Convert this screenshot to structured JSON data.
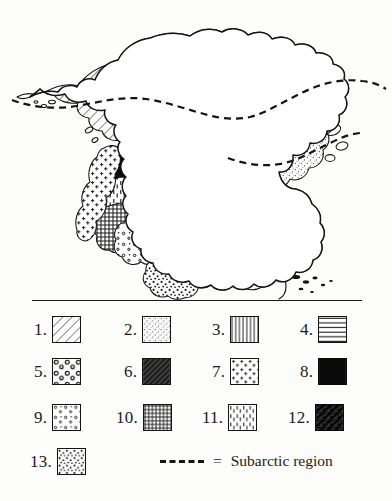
{
  "figure": {
    "type": "map",
    "region": "North America",
    "style": "hand-drawn pen-and-ink vegetation / biome map",
    "background_color": "#fdfdfb",
    "ink_color": "#141414"
  },
  "map": {
    "name": "north-america-vegetation-map",
    "subarctic_line_style": "dashed",
    "areas": [
      {
        "pattern": 1,
        "name": "diagonal-hatch-region",
        "location": "Alaska and central/northern Canada (boreal)"
      },
      {
        "pattern": 2,
        "name": "fine-stipple-region",
        "location": "Arctic Canada, Hudson Bay margin, eastern Canada"
      },
      {
        "pattern": 3,
        "name": "vertical-line-region",
        "location": "eastern United States / Appalachians"
      },
      {
        "pattern": 4,
        "name": "horizontal-line-region",
        "location": "northern Great Plains / prairie"
      },
      {
        "pattern": 5,
        "name": "circles-region",
        "location": "southeastern United States / Gulf coast"
      },
      {
        "pattern": 6,
        "name": "dense-dark-hatch-region",
        "location": "central plains interior"
      },
      {
        "pattern": 7,
        "name": "plus-marks-region",
        "location": "Pacific Northwest coastal strip"
      },
      {
        "pattern": 8,
        "name": "solid-black-region",
        "location": "Great Basin / western interior"
      },
      {
        "pattern": 9,
        "name": "sparse-dots-region",
        "location": "Rocky Mountain intermontane"
      },
      {
        "pattern": 10,
        "name": "crosshatch-grid-region",
        "location": "southwestern United States"
      },
      {
        "pattern": 11,
        "name": "vertical-dash-region",
        "location": "Great Basin desert scrub"
      },
      {
        "pattern": 12,
        "name": "dark-scribble-region",
        "location": "south-central plains"
      },
      {
        "pattern": 13,
        "name": "dense-dots-region",
        "location": "Mexican plateau / southern margin"
      }
    ]
  },
  "legend": {
    "name": "map-legend",
    "items": [
      {
        "number": "1.",
        "pattern": "diagonal-hatch"
      },
      {
        "number": "2.",
        "pattern": "fine-stipple"
      },
      {
        "number": "3.",
        "pattern": "vertical-lines"
      },
      {
        "number": "4.",
        "pattern": "horizontal-lines"
      },
      {
        "number": "5.",
        "pattern": "circles"
      },
      {
        "number": "6.",
        "pattern": "dense-dark-hatch"
      },
      {
        "number": "7.",
        "pattern": "plus-marks"
      },
      {
        "number": "8.",
        "pattern": "solid-black"
      },
      {
        "number": "9.",
        "pattern": "sparse-dots"
      },
      {
        "number": "10.",
        "pattern": "crosshatch-grid"
      },
      {
        "number": "11.",
        "pattern": "vertical-dashes"
      },
      {
        "number": "12.",
        "pattern": "dark-scribble"
      },
      {
        "number": "13.",
        "pattern": "dense-dots"
      }
    ],
    "subarctic": {
      "equals": "=",
      "label": "Subarctic region"
    }
  }
}
